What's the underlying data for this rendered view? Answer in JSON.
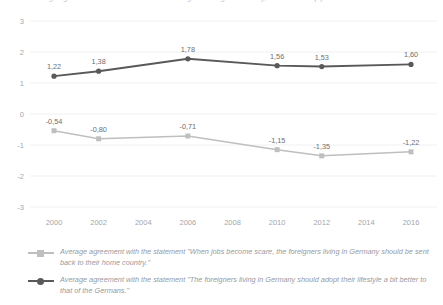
{
  "chart_data": {
    "type": "line",
    "title": "Average agreement with the statements on foreigners living in Germany, 2000 to 2016 (1)",
    "xlabel": "",
    "ylabel": "",
    "x": [
      2000,
      2002,
      2006,
      2010,
      2012,
      2016
    ],
    "categories": [
      "2000",
      "2002",
      "2006",
      "2010",
      "2012",
      "2016"
    ],
    "xticks": [
      "2000",
      "2002",
      "2004",
      "2006",
      "2008",
      "2010",
      "2012",
      "2014",
      "2016"
    ],
    "xlim": [
      2000,
      2016
    ],
    "ylim": [
      -3,
      3
    ],
    "yticks": [
      "3",
      "2",
      "1",
      "0",
      "-1",
      "-2",
      "-3"
    ],
    "grid": true,
    "legend_position": "bottom",
    "series": [
      {
        "name": "Average agreement with the statement \"When jobs become scare, the foreigners living in Germany should be sent back to their home country.\"",
        "color": "#bfbfbf",
        "marker": "square",
        "values": [
          -0.54,
          -0.8,
          -0.71,
          -1.15,
          -1.35,
          -1.22
        ],
        "labels": [
          "-0,54",
          "-0,80",
          "-0,71",
          "-1,15",
          "-1,35",
          "-1,22"
        ]
      },
      {
        "name": "Average agreement with the statement \"The foreigners living in Germany should adopt their lifestyle a bit better to that of the Germans.\"",
        "color": "#595959",
        "marker": "circle",
        "values": [
          1.22,
          1.38,
          1.78,
          1.56,
          1.53,
          1.6
        ],
        "labels": [
          "1,22",
          "1,38",
          "1,78",
          "1,56",
          "1,53",
          "1,60"
        ]
      }
    ]
  },
  "legend": {
    "items": [
      {
        "label": "Average agreement with the statement \"When jobs become scare, the foreigners living in Germany should be sent back to their home country.\"",
        "color": "#bfbfbf"
      },
      {
        "label": "Average agreement with the statement \"The foreigners living in Germany should adopt their lifestyle a bit better to that of the Germans.\"",
        "color": "#595959"
      }
    ]
  }
}
